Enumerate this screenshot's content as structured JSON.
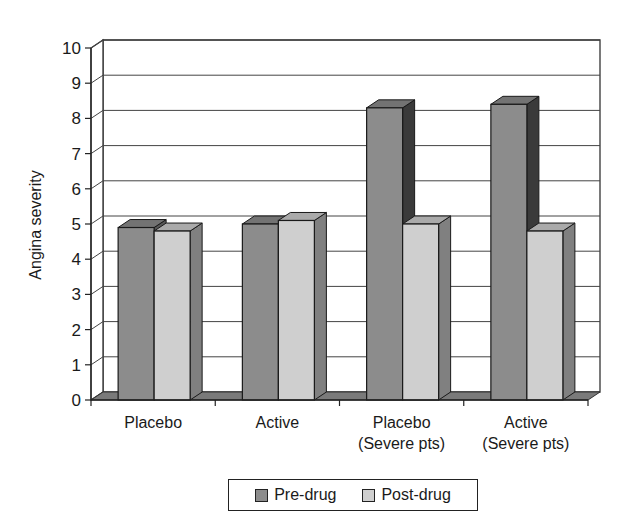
{
  "chart_data": {
    "type": "bar",
    "style": "3d-clustered-column",
    "title": "",
    "xlabel": "",
    "ylabel": "Angina severity",
    "ylim": [
      0,
      10
    ],
    "yticks": [
      0,
      1,
      2,
      3,
      4,
      5,
      6,
      7,
      8,
      9,
      10
    ],
    "grid": true,
    "legend_position": "bottom",
    "categories": [
      "Placebo",
      "Active",
      "Placebo (Severe pts)",
      "Active (Severe pts)"
    ],
    "category_label_lines": [
      [
        "Placebo"
      ],
      [
        "Active"
      ],
      [
        "Placebo",
        "(Severe pts)"
      ],
      [
        "Active",
        "(Severe pts)"
      ]
    ],
    "series": [
      {
        "name": "Pre-drug",
        "color": "#8c8c8c",
        "values": [
          4.9,
          5.0,
          8.3,
          8.4
        ]
      },
      {
        "name": "Post-drug",
        "color": "#cfcfcf",
        "values": [
          4.8,
          5.1,
          5.0,
          4.8
        ]
      }
    ]
  },
  "legend": {
    "items": [
      {
        "label": "Pre-drug",
        "color": "#8c8c8c"
      },
      {
        "label": "Post-drug",
        "color": "#cfcfcf"
      }
    ]
  }
}
